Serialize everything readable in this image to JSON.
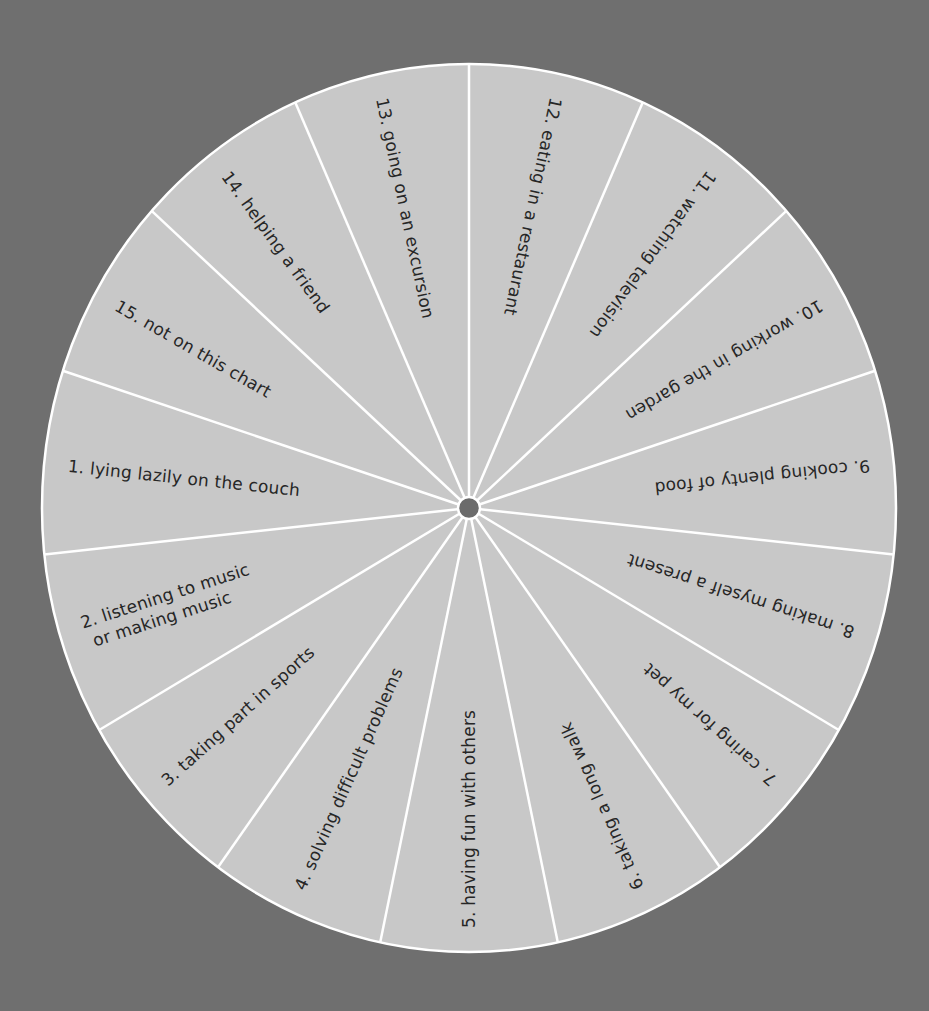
{
  "wheel": {
    "center": [
      469,
      508
    ],
    "radius_x": 427,
    "radius_y": 444,
    "start_angle_deg": -90,
    "segment_count": 15,
    "colors": {
      "background": "#6f6f6f",
      "disc": "#c8c8c8",
      "divider": "#ffffff",
      "hub": "#6b6b6b",
      "text": "#262626"
    },
    "segments": [
      {
        "number": "12.",
        "lines": [
          "eating in a restaurant"
        ],
        "center_angle": -78
      },
      {
        "number": "11.",
        "lines": [
          "watching television"
        ],
        "center_angle": -54
      },
      {
        "number": "10.",
        "lines": [
          "working in the garden"
        ],
        "center_angle": -30
      },
      {
        "number": "9.",
        "lines": [
          "cooking plenty of food"
        ],
        "center_angle": -6
      },
      {
        "number": "8.",
        "lines": [
          "making myself a present"
        ],
        "center_angle": 18
      },
      {
        "number": "7.",
        "lines": [
          "caring for my pet"
        ],
        "center_angle": 42
      },
      {
        "number": "6.",
        "lines": [
          "taking a long walk"
        ],
        "center_angle": 66
      },
      {
        "number": "5.",
        "lines": [
          "having fun with others"
        ],
        "center_angle": 90
      },
      {
        "number": "4.",
        "lines": [
          "solving difficult problems"
        ],
        "center_angle": 114
      },
      {
        "number": "3.",
        "lines": [
          "taking part in sports"
        ],
        "center_angle": 138
      },
      {
        "number": "2.",
        "lines": [
          "listening to music",
          "or making music"
        ],
        "center_angle": 162
      },
      {
        "number": "1.",
        "lines": [
          "lying lazily on the couch"
        ],
        "center_angle": 186
      },
      {
        "number": "15.",
        "lines": [
          "not on this chart"
        ],
        "center_angle": 210
      },
      {
        "number": "14.",
        "lines": [
          "helping a friend"
        ],
        "center_angle": 234
      },
      {
        "number": "13.",
        "lines": [
          "going on an excursion"
        ],
        "center_angle": 258
      }
    ]
  }
}
